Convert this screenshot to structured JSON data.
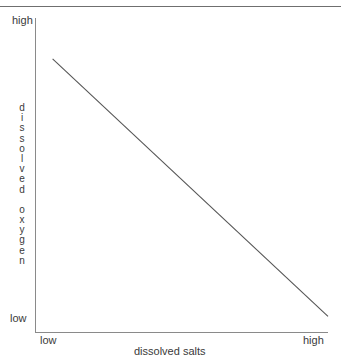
{
  "chart_data": {
    "type": "line",
    "title": "",
    "subtitle": "",
    "xlabel": "dissolved salts",
    "ylabel": "dissolved oxygen",
    "xtick_labels": [
      "low",
      "high"
    ],
    "ytick_labels": [
      "low",
      "high"
    ],
    "xlim_labels": {
      "min": "low",
      "max": "high"
    },
    "ylim_labels": {
      "min": "low",
      "max": "high"
    },
    "grid": false,
    "legend": false,
    "legend_position": "none",
    "annotations": [],
    "series": [
      {
        "name": "dissolved oxygen vs dissolved salts",
        "relationship": "inverse linear",
        "x": [
          0.06,
          1.0
        ],
        "y": [
          0.87,
          0.05
        ]
      }
    ]
  },
  "axes": {
    "y_high_label": "high",
    "y_low_label": "low",
    "x_low_label": "low",
    "x_high_label": "high",
    "x_title": "dissolved salts",
    "y_title_letters": [
      "d",
      "i",
      "s",
      "s",
      "o",
      "l",
      "v",
      "e",
      "d",
      " ",
      "o",
      "x",
      "y",
      "g",
      "e",
      "n"
    ]
  },
  "colors": {
    "background": "#ffffff",
    "axis": "#8a8a8a",
    "rule": "#6f6f6f",
    "data_line": "#555555",
    "text": "#3a3a3a"
  }
}
